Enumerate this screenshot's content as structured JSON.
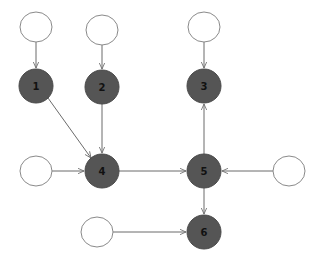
{
  "diagram": {
    "type": "directed-graph",
    "colors": {
      "background": "#ffffff",
      "dark_node": "#555555",
      "white_node_stroke": "#8a8a8a",
      "edge": "#6b6b6b",
      "label": "#111111"
    },
    "nodes": [
      {
        "id": "in1",
        "label": "",
        "kind": "input",
        "x": 36,
        "y": 27
      },
      {
        "id": "in2",
        "label": "",
        "kind": "input",
        "x": 102,
        "y": 30
      },
      {
        "id": "in3",
        "label": "",
        "kind": "input",
        "x": 204,
        "y": 27
      },
      {
        "id": "n1",
        "label": "1",
        "kind": "state",
        "x": 36,
        "y": 86
      },
      {
        "id": "n2",
        "label": "2",
        "kind": "state",
        "x": 102,
        "y": 87
      },
      {
        "id": "n3",
        "label": "3",
        "kind": "state",
        "x": 204,
        "y": 86
      },
      {
        "id": "in4",
        "label": "",
        "kind": "input",
        "x": 36,
        "y": 171
      },
      {
        "id": "n4",
        "label": "4",
        "kind": "state",
        "x": 102,
        "y": 171
      },
      {
        "id": "n5",
        "label": "5",
        "kind": "state",
        "x": 204,
        "y": 171
      },
      {
        "id": "in5",
        "label": "",
        "kind": "input",
        "x": 289,
        "y": 171
      },
      {
        "id": "in6",
        "label": "",
        "kind": "input",
        "x": 97,
        "y": 232
      },
      {
        "id": "n6",
        "label": "6",
        "kind": "state",
        "x": 204,
        "y": 232
      }
    ],
    "edges": [
      {
        "from": "in1",
        "to": "n1"
      },
      {
        "from": "in2",
        "to": "n2"
      },
      {
        "from": "in3",
        "to": "n3"
      },
      {
        "from": "n1",
        "to": "n4"
      },
      {
        "from": "n2",
        "to": "n4"
      },
      {
        "from": "in4",
        "to": "n4"
      },
      {
        "from": "n4",
        "to": "n5"
      },
      {
        "from": "n5",
        "to": "n3"
      },
      {
        "from": "in5",
        "to": "n5"
      },
      {
        "from": "n5",
        "to": "n6"
      },
      {
        "from": "in6",
        "to": "n6"
      }
    ]
  }
}
